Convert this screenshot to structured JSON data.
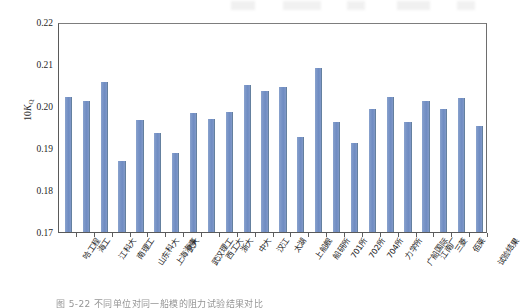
{
  "figure": {
    "caption": "图 5-22  不同单位对同一船模的阻力试验结果对比",
    "y_axis_title_prefix": "10",
    "y_axis_title_symbol": "K",
    "y_axis_title_subscript": "Q"
  },
  "chart_data": {
    "type": "bar",
    "title": "",
    "xlabel": "",
    "ylabel": "10K_Q",
    "ylim": [
      0.17,
      0.22
    ],
    "ytick_labels": [
      "0.22",
      "0.21",
      "0.20",
      "0.19",
      "0.18",
      "0.17"
    ],
    "yticks": [
      0.22,
      0.21,
      0.2,
      0.19,
      0.18,
      0.17
    ],
    "grid": false,
    "legend": null,
    "bar_color": "#7b96c8",
    "categories": [
      "哈工程",
      "海工",
      "江科大",
      "南理工",
      "山东科大",
      "上海海事",
      "武大",
      "武汉理工",
      "西工大",
      "浙大",
      "中大",
      "汉江",
      "太湖",
      "上船舰",
      "船研所",
      "701所",
      "702所",
      "704所",
      "力学所",
      "广船国际",
      "江南厂",
      "三菱",
      "佰莱",
      "试验结果"
    ],
    "values": [
      0.2022,
      0.2013,
      0.2057,
      0.187,
      0.1966,
      0.1935,
      0.1887,
      0.1983,
      0.1968,
      0.1985,
      0.2051,
      0.2035,
      0.2046,
      0.1927,
      0.2091,
      0.1961,
      0.1912,
      0.1994,
      0.2022,
      0.1963,
      0.2012,
      0.1994,
      0.202,
      0.1953
    ]
  }
}
